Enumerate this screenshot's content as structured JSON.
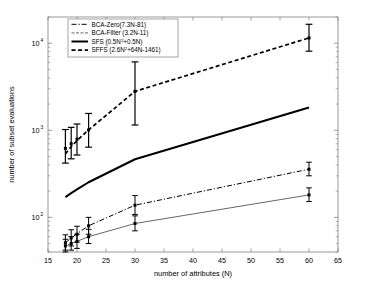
{
  "chart_data": {
    "type": "line",
    "title": "",
    "xlabel": "number of attributes (N)",
    "ylabel": "number of subset evaluations",
    "xlim": [
      15,
      65
    ],
    "ylim": [
      40,
      20000
    ],
    "yscale": "log",
    "xticks": [
      15,
      20,
      25,
      30,
      35,
      40,
      45,
      50,
      55,
      60,
      65
    ],
    "xtick_labels": [
      "15",
      "20",
      "25",
      "30",
      "35",
      "40",
      "45",
      "50",
      "55",
      "60",
      "65"
    ],
    "yticks": [
      100,
      1000,
      10000
    ],
    "ytick_labels": [
      "10",
      "10",
      "10"
    ],
    "ytick_exponents": [
      "2",
      "3",
      "4"
    ],
    "grid": false,
    "legend_position": "top-left",
    "series": [
      {
        "name": "BCA-Zero(7.3N-81)",
        "style": "dash-dot",
        "color": "#000000",
        "width": 1.0,
        "x": [
          18,
          19,
          20,
          22,
          30,
          60
        ],
        "values": [
          51,
          58,
          65,
          80,
          138,
          357
        ],
        "errorbars": [
          {
            "x": 18,
            "y": 51,
            "low": 42,
            "high": 63
          },
          {
            "x": 19,
            "y": 58,
            "low": 47,
            "high": 72
          },
          {
            "x": 20,
            "y": 64,
            "low": 52,
            "high": 79
          },
          {
            "x": 22,
            "y": 80,
            "low": 64,
            "high": 100
          },
          {
            "x": 30,
            "y": 138,
            "low": 108,
            "high": 178
          },
          {
            "x": 60,
            "y": 357,
            "low": 300,
            "high": 430
          }
        ]
      },
      {
        "name": "BCA-Filter (3.2N-11)",
        "style": "solid-thin",
        "color": "#555555",
        "width": 0.9,
        "x": [
          18,
          19,
          20,
          22,
          30,
          60
        ],
        "values": [
          47,
          50,
          53,
          60,
          85,
          181
        ],
        "errorbars": [
          {
            "x": 18,
            "y": 47,
            "low": 40,
            "high": 56
          },
          {
            "x": 19,
            "y": 50,
            "low": 42,
            "high": 60
          },
          {
            "x": 20,
            "y": 53,
            "low": 44,
            "high": 64
          },
          {
            "x": 22,
            "y": 60,
            "low": 50,
            "high": 73
          },
          {
            "x": 30,
            "y": 85,
            "low": 70,
            "high": 104
          },
          {
            "x": 60,
            "y": 181,
            "low": 152,
            "high": 218
          }
        ]
      },
      {
        "name": "SFS (0.5N²+0.5N)",
        "style": "solid-thick",
        "color": "#000000",
        "width": 2.0,
        "x": [
          18,
          19,
          20,
          22,
          30,
          60
        ],
        "values": [
          171,
          190,
          210,
          253,
          465,
          1830
        ],
        "errorbars": []
      },
      {
        "name": "SFFS (2.6N²+64N-1461)",
        "style": "dashed-thick",
        "color": "#000000",
        "width": 1.7,
        "x": [
          18,
          19,
          20,
          22,
          30,
          60
        ],
        "values": [
          535,
          650,
          760,
          1010,
          2800,
          11500
        ],
        "errorbars": [
          {
            "x": 18,
            "y": 620,
            "low": 420,
            "high": 1020
          },
          {
            "x": 19,
            "y": 700,
            "low": 470,
            "high": 1080
          },
          {
            "x": 20,
            "y": 790,
            "low": 520,
            "high": 1180
          },
          {
            "x": 22,
            "y": 1010,
            "low": 640,
            "high": 1560
          },
          {
            "x": 30,
            "y": 2800,
            "low": 1150,
            "high": 6100
          },
          {
            "x": 60,
            "y": 11500,
            "low": 8100,
            "high": 16500
          }
        ]
      }
    ],
    "legend_entries": [
      {
        "label": "BCA-Zero(7.3N-81)",
        "style": "dash-dot"
      },
      {
        "label": "BCA-Filter (3.2N-11)",
        "style": "solid-thin"
      },
      {
        "label": "SFS (0.5N",
        "sup": "2",
        "label_tail": "+0.5N)",
        "style": "solid-thick"
      },
      {
        "label": "SFFS (2.6N",
        "sup": "2",
        "label_tail": "+64N-1461)",
        "style": "dashed-thick"
      }
    ]
  }
}
